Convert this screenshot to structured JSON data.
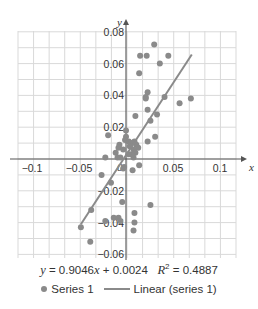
{
  "chart_data": {
    "type": "scatter",
    "title": "",
    "xlabel": "x",
    "ylabel": "y",
    "xlim": [
      -0.115,
      0.117
    ],
    "ylim": [
      -0.063,
      0.08
    ],
    "grid": true,
    "x_ticks": [
      {
        "value": -0.1,
        "label": "−0.1"
      },
      {
        "value": -0.05,
        "label": "−0.05"
      },
      {
        "value": 0.05,
        "label": "0.05"
      },
      {
        "value": 0.1,
        "label": "0.1"
      }
    ],
    "y_ticks": [
      {
        "value": 0.08,
        "label": "0.08"
      },
      {
        "value": 0.06,
        "label": "0.06"
      },
      {
        "value": 0.04,
        "label": "0.04"
      },
      {
        "value": 0.02,
        "label": "0.02"
      },
      {
        "value": -0.02,
        "label": "−0.02"
      },
      {
        "value": -0.04,
        "label": "−0.04"
      },
      {
        "value": -0.06,
        "label": "−0.06"
      }
    ],
    "origin_label": "0",
    "series": [
      {
        "name": "Series 1",
        "kind": "scatter",
        "color": "#8a8a8a",
        "points": [
          [
            0.03,
            0.072
          ],
          [
            0.015,
            0.065
          ],
          [
            0.022,
            0.065
          ],
          [
            0.045,
            0.065
          ],
          [
            0.036,
            0.06
          ],
          [
            0.014,
            0.054
          ],
          [
            0.023,
            0.042
          ],
          [
            0.021,
            0.039
          ],
          [
            0.021,
            0.038
          ],
          [
            0.041,
            0.039
          ],
          [
            0.057,
            0.035
          ],
          [
            0.069,
            0.038
          ],
          [
            0.023,
            0.031
          ],
          [
            0.01,
            0.027
          ],
          [
            0.033,
            0.028
          ],
          [
            0.026,
            0.024
          ],
          [
            0.031,
            0.014
          ],
          [
            0.023,
            0.011
          ],
          [
            -0.019,
            0.015
          ],
          [
            0.0,
            0.018
          ],
          [
            0.0,
            0.014
          ],
          [
            -0.001,
            0.012
          ],
          [
            0.003,
            0.011
          ],
          [
            0.009,
            0.011
          ],
          [
            0.011,
            0.009
          ],
          [
            0.013,
            0.007
          ],
          [
            -0.007,
            0.009
          ],
          [
            -0.008,
            0.007
          ],
          [
            0.006,
            0.01
          ],
          [
            0.004,
            0.008
          ],
          [
            0.008,
            0.006
          ],
          [
            0.01,
            0.004
          ],
          [
            0.006,
            0.003
          ],
          [
            -0.011,
            0.004
          ],
          [
            -0.009,
            0.001
          ],
          [
            -0.006,
            0.001
          ],
          [
            -0.022,
            0.001
          ],
          [
            0.008,
            0.001
          ],
          [
            0.003,
            0.003
          ],
          [
            -0.003,
            0.006
          ],
          [
            0.014,
            -0.004
          ],
          [
            0.007,
            -0.007
          ],
          [
            -0.002,
            -0.005
          ],
          [
            -0.003,
            -0.006
          ],
          [
            -0.026,
            -0.01
          ],
          [
            -0.016,
            -0.015
          ],
          [
            -0.004,
            -0.027
          ],
          [
            0.026,
            -0.029
          ],
          [
            0.009,
            -0.034
          ],
          [
            -0.037,
            -0.032
          ],
          [
            -0.013,
            -0.037
          ],
          [
            -0.008,
            -0.037
          ],
          [
            -0.022,
            -0.039
          ],
          [
            -0.006,
            -0.039
          ],
          [
            0.009,
            -0.04
          ],
          [
            0.008,
            -0.045
          ],
          [
            -0.048,
            -0.043
          ],
          [
            -0.038,
            -0.052
          ]
        ]
      },
      {
        "name": "Linear (series 1)",
        "kind": "line",
        "color": "#8a8a8a",
        "slope": 0.9046,
        "intercept": 0.0024,
        "x_range": [
          -0.048,
          0.07
        ]
      }
    ],
    "annotations": [
      "y = 0.9046x + 0.0024   R² = 0.4887"
    ],
    "legend": {
      "position": "bottom",
      "entries": [
        "Series 1",
        "Linear (series 1)"
      ]
    }
  },
  "equation": {
    "y": "y",
    "rhs": " = 0.9046",
    "x": "x",
    "tail": " + 0.0024",
    "r": "R",
    "sup": "2",
    "r_value": " = 0.4887"
  },
  "legend": {
    "series1": "Series 1",
    "linear": "Linear (series 1)"
  }
}
